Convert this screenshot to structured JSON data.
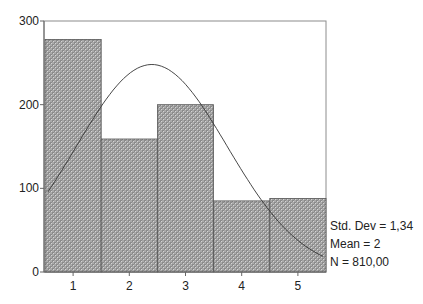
{
  "chart_data": {
    "type": "bar",
    "subtype": "histogram-with-normal-curve",
    "title": "",
    "xlabel": "",
    "ylabel": "",
    "categories": [
      "1",
      "2",
      "3",
      "4",
      "5"
    ],
    "values": [
      278,
      159,
      200,
      85,
      88
    ],
    "ylim": [
      0,
      300
    ],
    "yticks": [
      0,
      100,
      200,
      300
    ],
    "xticks": [
      "1",
      "2",
      "3",
      "4",
      "5"
    ],
    "grid": false,
    "legend": null,
    "overlay": {
      "type": "normal-curve",
      "mean": 2.4,
      "peak_value": 248,
      "points": [
        [
          0.55,
          91
        ],
        [
          1.0,
          150
        ],
        [
          1.5,
          219
        ],
        [
          2.0,
          240
        ],
        [
          2.4,
          248
        ],
        [
          3.0,
          200
        ],
        [
          3.5,
          147
        ],
        [
          4.0,
          88
        ],
        [
          4.5,
          50
        ],
        [
          5.45,
          19
        ]
      ]
    },
    "annotations": [
      "Std. Dev = 1,34",
      "Mean = 2",
      "N = 810,00"
    ]
  },
  "stats": {
    "std_dev": "Std. Dev = 1,34",
    "mean": "Mean = 2",
    "n": "N = 810,00"
  },
  "axis": {
    "y_labels": [
      "0",
      "100",
      "200",
      "300"
    ],
    "x_labels": [
      "1",
      "2",
      "3",
      "4",
      "5"
    ]
  },
  "colors": {
    "bar_fill_base": "#a8a8a8",
    "bar_fill_dark": "#7a7a7a",
    "bar_fill_light": "#d0d0d0",
    "bar_edge": "#555555",
    "curve": "#333333",
    "frame": "#888888"
  }
}
